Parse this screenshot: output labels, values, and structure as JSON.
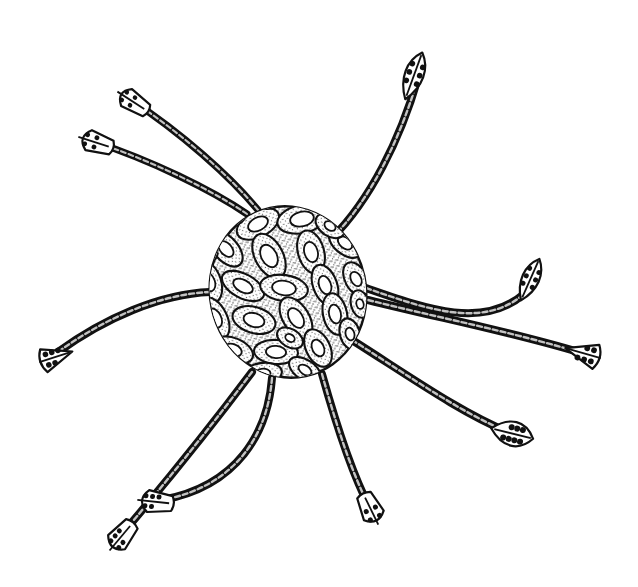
{
  "figure": {
    "domain": "scientific-illustration",
    "background_color": "#ffffff",
    "ink_color": "#111111",
    "stipple_color": "#2a2a2a",
    "pore_fill_color": "#ffffff",
    "canvas": {
      "width": 638,
      "height": 587
    },
    "caption": ""
  },
  "body": {
    "name": "central-shell",
    "center_x": 288,
    "center_y": 292,
    "radius_x": 78,
    "radius_y": 86,
    "rotation_deg": -12,
    "outline_width": 2.4,
    "pore_count": 30,
    "description": "Spherical latticed shell covered in oval pore-frames with stippled intervening surface"
  },
  "pores": [
    {
      "cx": 258,
      "cy": 224,
      "rx": 23,
      "ry": 13,
      "rot": -28,
      "inner": 0.46
    },
    {
      "cx": 302,
      "cy": 219,
      "rx": 25,
      "ry": 14,
      "rot": -12,
      "inner": 0.48
    },
    {
      "cx": 226,
      "cy": 249,
      "rx": 21,
      "ry": 12,
      "rot": 48,
      "inner": 0.44
    },
    {
      "cx": 269,
      "cy": 256,
      "rx": 24,
      "ry": 14,
      "rot": 62,
      "inner": 0.5
    },
    {
      "cx": 311,
      "cy": 252,
      "rx": 22,
      "ry": 13,
      "rot": 74,
      "inner": 0.47
    },
    {
      "cx": 345,
      "cy": 243,
      "rx": 19,
      "ry": 11,
      "rot": 40,
      "inner": 0.43
    },
    {
      "cx": 209,
      "cy": 282,
      "rx": 21,
      "ry": 12,
      "rot": 72,
      "inner": 0.45
    },
    {
      "cx": 243,
      "cy": 286,
      "rx": 23,
      "ry": 12,
      "rot": 28,
      "inner": 0.46
    },
    {
      "cx": 284,
      "cy": 288,
      "rx": 24,
      "ry": 13,
      "rot": 8,
      "inner": 0.5
    },
    {
      "cx": 325,
      "cy": 285,
      "rx": 21,
      "ry": 12,
      "rot": 70,
      "inner": 0.45
    },
    {
      "cx": 356,
      "cy": 279,
      "rx": 18,
      "ry": 11,
      "rot": 62,
      "inner": 0.42
    },
    {
      "cx": 215,
      "cy": 318,
      "rx": 22,
      "ry": 12,
      "rot": 64,
      "inner": 0.46
    },
    {
      "cx": 254,
      "cy": 320,
      "rx": 22,
      "ry": 13,
      "rot": 16,
      "inner": 0.48
    },
    {
      "cx": 296,
      "cy": 318,
      "rx": 23,
      "ry": 13,
      "rot": 58,
      "inner": 0.47
    },
    {
      "cx": 335,
      "cy": 314,
      "rx": 21,
      "ry": 12,
      "rot": 78,
      "inner": 0.45
    },
    {
      "cx": 233,
      "cy": 350,
      "rx": 21,
      "ry": 12,
      "rot": 22,
      "inner": 0.44
    },
    {
      "cx": 276,
      "cy": 352,
      "rx": 22,
      "ry": 12,
      "rot": 4,
      "inner": 0.46
    },
    {
      "cx": 318,
      "cy": 348,
      "rx": 20,
      "ry": 12,
      "rot": 64,
      "inner": 0.44
    },
    {
      "cx": 262,
      "cy": 374,
      "rx": 20,
      "ry": 11,
      "rot": -8,
      "inner": 0.43
    },
    {
      "cx": 305,
      "cy": 370,
      "rx": 18,
      "ry": 10,
      "rot": 34,
      "inner": 0.4
    },
    {
      "cx": 350,
      "cy": 334,
      "rx": 16,
      "ry": 10,
      "rot": 74,
      "inner": 0.4
    },
    {
      "cx": 204,
      "cy": 249,
      "rx": 15,
      "ry": 10,
      "rot": 36,
      "inner": 0.38
    },
    {
      "cx": 330,
      "cy": 226,
      "rx": 16,
      "ry": 10,
      "rot": 34,
      "inner": 0.38
    },
    {
      "cx": 236,
      "cy": 215,
      "rx": 15,
      "ry": 9,
      "rot": -40,
      "inner": 0.36
    },
    {
      "cx": 290,
      "cy": 338,
      "rx": 14,
      "ry": 9,
      "rot": 30,
      "inner": 0.36
    },
    {
      "cx": 238,
      "cy": 373,
      "rx": 14,
      "ry": 9,
      "rot": 14,
      "inner": 0.36
    },
    {
      "cx": 200,
      "cy": 305,
      "rx": 14,
      "ry": 9,
      "rot": 68,
      "inner": 0.36
    },
    {
      "cx": 360,
      "cy": 304,
      "rx": 14,
      "ry": 9,
      "rot": 76,
      "inner": 0.36
    },
    {
      "cx": 324,
      "cy": 203,
      "rx": 14,
      "ry": 8,
      "rot": -6,
      "inner": 0.34
    },
    {
      "cx": 272,
      "cy": 200,
      "rx": 14,
      "ry": 8,
      "rot": -20,
      "inner": 0.34
    }
  ],
  "spines": [
    {
      "id": "spine-upper-right",
      "label": "Upper-right spine",
      "base_x": 332,
      "base_y": 238,
      "path": "M332,238 C370,200 400,140 418,78",
      "tip_x": 421,
      "tip_y": 56,
      "tip_angle_deg": -70,
      "tip_shape": "lanceolate",
      "tip_length": 46,
      "tip_width": 24,
      "tip_dots": 6,
      "base_width": 8
    },
    {
      "id": "spine-upper-left-a",
      "label": "Upper-left spine A",
      "base_x": 258,
      "base_y": 210,
      "path": "M258,210 C230,176 180,132 131,100",
      "tip_x": 118,
      "tip_y": 92,
      "tip_angle_deg": 213,
      "tip_shape": "paddle",
      "tip_length": 34,
      "tip_width": 20,
      "tip_dots": 4,
      "base_width": 7
    },
    {
      "id": "spine-upper-left-b",
      "label": "Upper-left spine B",
      "base_x": 247,
      "base_y": 214,
      "path": "M247,214 C212,190 150,160 95,142",
      "tip_x": 79,
      "tip_y": 137,
      "tip_angle_deg": 198,
      "tip_shape": "paddle",
      "tip_length": 34,
      "tip_width": 21,
      "tip_dots": 4,
      "base_width": 7
    },
    {
      "id": "spine-left",
      "label": "Left spine",
      "base_x": 210,
      "base_y": 292,
      "path": "M210,292 C160,294 105,318 58,352",
      "tip_x": 40,
      "tip_y": 362,
      "tip_angle_deg": 162,
      "tip_shape": "fan",
      "tip_length": 34,
      "tip_width": 24,
      "tip_dots": 5,
      "base_width": 8
    },
    {
      "id": "spine-right-upper",
      "label": "Right upper spine",
      "base_x": 366,
      "base_y": 288,
      "path": "M366,288 C424,308 482,330 524,294",
      "tip_x": 538,
      "tip_y": 262,
      "tip_angle_deg": -66,
      "tip_shape": "lanceolate",
      "tip_length": 42,
      "tip_width": 22,
      "tip_dots": 6,
      "base_width": 8
    },
    {
      "id": "spine-right-lower",
      "label": "Right lower spine",
      "base_x": 368,
      "base_y": 300,
      "path": "M368,300 C440,318 512,332 578,352",
      "tip_x": 600,
      "tip_y": 358,
      "tip_angle_deg": 16,
      "tip_shape": "fan",
      "tip_length": 36,
      "tip_width": 25,
      "tip_dots": 5,
      "base_width": 8
    },
    {
      "id": "spine-lower-right",
      "label": "Lower-right spine",
      "base_x": 352,
      "base_y": 340,
      "path": "M352,340 C412,378 460,412 508,432",
      "tip_x": 530,
      "tip_y": 438,
      "tip_angle_deg": 14,
      "tip_shape": "lanceolate-wide",
      "tip_length": 40,
      "tip_width": 26,
      "tip_dots": 7,
      "base_width": 8
    },
    {
      "id": "spine-bottom-right",
      "label": "Bottom-right spine",
      "base_x": 322,
      "base_y": 374,
      "path": "M322,374 C336,424 352,474 370,508",
      "tip_x": 378,
      "tip_y": 524,
      "tip_angle_deg": 64,
      "tip_shape": "paddle",
      "tip_length": 32,
      "tip_width": 22,
      "tip_dots": 4,
      "base_width": 8
    },
    {
      "id": "spine-bottom-curve",
      "label": "Bottom curving spine",
      "base_x": 272,
      "base_y": 378,
      "path": "M272,378 C268,432 238,486 162,500",
      "tip_x": 138,
      "tip_y": 500,
      "tip_angle_deg": 186,
      "tip_shape": "paddle",
      "tip_length": 34,
      "tip_width": 22,
      "tip_dots": 5,
      "base_width": 8
    },
    {
      "id": "spine-lower-left",
      "label": "Lower-left spine",
      "base_x": 252,
      "base_y": 372,
      "path": "M252,372 C216,420 168,480 122,534",
      "tip_x": 110,
      "tip_y": 550,
      "tip_angle_deg": 130,
      "tip_shape": "paddle",
      "tip_length": 34,
      "tip_width": 22,
      "tip_dots": 5,
      "base_width": 8
    }
  ]
}
